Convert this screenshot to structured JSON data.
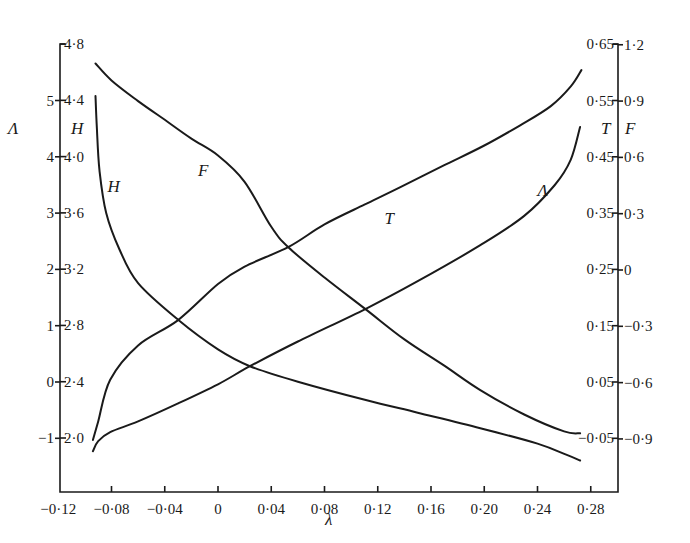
{
  "chart_data": {
    "type": "line",
    "title": "",
    "xlabel": "λ",
    "xlim": [
      -0.12,
      0.3
    ],
    "x_ticks": [
      "−0·12",
      "−0·08",
      "−0·04",
      "0",
      "0·04",
      "0·08",
      "0·12",
      "0·16",
      "0·20",
      "0·24",
      "0·28"
    ],
    "x_tick_values": [
      -0.12,
      -0.08,
      -0.04,
      0,
      0.04,
      0.08,
      0.12,
      0.16,
      0.2,
      0.24,
      0.28
    ],
    "axes": {
      "left_outer": {
        "label": "Λ",
        "ticks": [
          "5",
          "4",
          "3",
          "2",
          "1",
          "0",
          "−1"
        ],
        "tick_values": [
          5,
          4,
          3,
          2,
          1,
          0,
          -1
        ]
      },
      "left_inner": {
        "label": "H",
        "ticks": [
          "4·8",
          "4·4",
          "4·0",
          "3·6",
          "3·2",
          "2·8",
          "2·4",
          "2·0"
        ],
        "tick_values": [
          4.8,
          4.4,
          4.0,
          3.6,
          3.2,
          2.8,
          2.4,
          2.0
        ]
      },
      "right_inner": {
        "label": "T",
        "ticks": [
          "0·65",
          "0·55",
          "0·45",
          "0·35",
          "0·25",
          "0·15",
          "0·05",
          "−0·05"
        ],
        "tick_values": [
          0.65,
          0.55,
          0.45,
          0.35,
          0.25,
          0.15,
          0.05,
          -0.05
        ]
      },
      "right_outer": {
        "label": "F",
        "ticks": [
          "1·2",
          "0·9",
          "0·6",
          "0·3",
          "0",
          "−0·3",
          "−0·6",
          "−0·9"
        ],
        "tick_values": [
          1.2,
          0.9,
          0.6,
          0.3,
          0,
          -0.3,
          -0.6,
          -0.9
        ]
      }
    },
    "grid": false,
    "legend": "none (curves labelled inline)",
    "series": [
      {
        "name": "F",
        "axis": "right_outer",
        "x": [
          -0.092,
          -0.08,
          -0.06,
          -0.04,
          -0.02,
          0,
          0.02,
          0.04,
          0.053,
          0.08,
          0.111,
          0.14,
          0.17,
          0.197,
          0.23,
          0.26,
          0.272
        ],
        "values": [
          1.1,
          1.01,
          0.9,
          0.8,
          0.7,
          0.61,
          0.47,
          0.23,
          0.12,
          -0.04,
          -0.21,
          -0.37,
          -0.51,
          -0.64,
          -0.77,
          -0.86,
          -0.87
        ],
        "label_pos": {
          "x": -0.015,
          "y": 0.5
        }
      },
      {
        "name": "T",
        "axis": "right_inner",
        "x": [
          -0.094,
          -0.09,
          -0.081,
          -0.06,
          -0.03,
          0,
          0.02,
          0.053,
          0.08,
          0.11,
          0.137,
          0.17,
          0.2,
          0.227,
          0.25,
          0.265,
          0.273
        ],
        "values": [
          -0.053,
          -0.02,
          0.054,
          0.115,
          0.16,
          0.224,
          0.255,
          0.29,
          0.33,
          0.365,
          0.396,
          0.435,
          0.47,
          0.506,
          0.54,
          0.575,
          0.604
        ],
        "label_pos": {
          "x": 0.125,
          "y": 0.33
        }
      },
      {
        "name": "Λ",
        "axis": "left_outer",
        "x": [
          -0.094,
          -0.09,
          -0.081,
          -0.06,
          -0.03,
          0,
          0.024,
          0.06,
          0.111,
          0.15,
          0.197,
          0.23,
          0.253,
          0.265,
          0.272
        ],
        "values": [
          -1.23,
          -1.05,
          -0.89,
          -0.7,
          -0.38,
          -0.04,
          0.28,
          0.72,
          1.3,
          1.79,
          2.43,
          2.95,
          3.5,
          3.95,
          4.53
        ],
        "label_pos": {
          "x": 0.24,
          "y": 3.3
        }
      },
      {
        "name": "H",
        "axis": "left_inner",
        "x": [
          -0.092,
          -0.091,
          -0.089,
          -0.084,
          -0.074,
          -0.06,
          -0.03,
          0,
          0.024,
          0.06,
          0.111,
          0.15,
          0.197,
          0.24,
          0.262,
          0.272
        ],
        "values": [
          4.43,
          4.2,
          3.9,
          3.6,
          3.34,
          3.1,
          2.84,
          2.63,
          2.51,
          2.4,
          2.27,
          2.18,
          2.07,
          1.96,
          1.88,
          1.84
        ],
        "label_pos": {
          "x": -0.083,
          "y": 3.75
        }
      }
    ]
  },
  "labels": {
    "x_axis_title": "λ",
    "left_outer_title": "Λ",
    "left_inner_title": "H",
    "right_inner_title": "T",
    "right_outer_title": "F"
  }
}
